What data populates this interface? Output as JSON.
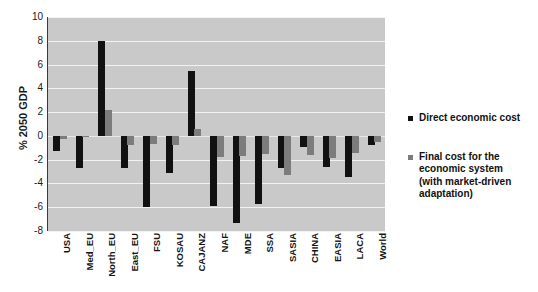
{
  "chart_data": {
    "type": "bar",
    "title": "",
    "xlabel": "",
    "ylabel": "% 2050 GDP",
    "ylim": [
      -8,
      10
    ],
    "yticks": [
      10,
      8,
      6,
      4,
      2,
      0,
      -2,
      -4,
      -6,
      -8
    ],
    "grid": true,
    "legend_position": "right",
    "categories": [
      "USA",
      "Med_EU",
      "North_EU",
      "East_EU",
      "FSU",
      "KOSAU",
      "CAJANZ",
      "NAF",
      "MDE",
      "SSA",
      "SASIA",
      "CHINA",
      "EASIA",
      "LACA",
      "World"
    ],
    "series": [
      {
        "name": "Direct economic cost",
        "color": "#111111",
        "values": [
          -1.3,
          -2.7,
          8.0,
          -2.7,
          -6.0,
          -3.1,
          5.5,
          -5.9,
          -7.3,
          -5.7,
          -2.7,
          -0.9,
          -2.6,
          -3.5,
          -0.8
        ]
      },
      {
        "name": "Final cost for the economic system (with market-driven adaptation)",
        "color": "#7c7c7c",
        "values": [
          -0.25,
          -0.1,
          2.2,
          -0.8,
          -0.7,
          -0.8,
          0.6,
          -1.8,
          -1.7,
          -1.5,
          -3.3,
          -1.6,
          -1.9,
          -1.4,
          -0.5
        ]
      }
    ]
  },
  "legend": {
    "items": [
      {
        "label": "Direct economic cost",
        "color": "#111111"
      },
      {
        "label": "Final cost for the economic system (with market-driven adaptation)",
        "color": "#7c7c7c"
      }
    ]
  },
  "colors": {
    "plot_background": "#c9c9c9",
    "gridline": "#f2f2f2",
    "axis": "#3a3a3a",
    "direct": "#111111",
    "final": "#7c7c7c"
  }
}
